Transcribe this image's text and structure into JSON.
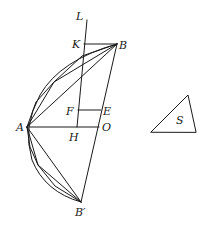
{
  "diagram": {
    "points": {
      "L": {
        "label": "L",
        "x": 87,
        "y": 20,
        "lx": 76,
        "ly": 20
      },
      "K": {
        "label": "K",
        "x": 84,
        "y": 44,
        "lx": 72,
        "ly": 48
      },
      "B": {
        "label": "B",
        "x": 117,
        "y": 44,
        "lx": 119,
        "ly": 49
      },
      "F": {
        "label": "F",
        "x": 78,
        "y": 110,
        "lx": 66,
        "ly": 115
      },
      "E": {
        "label": "E",
        "x": 101,
        "y": 110,
        "lx": 103,
        "ly": 115
      },
      "A": {
        "label": "A",
        "x": 27,
        "y": 127,
        "lx": 16,
        "ly": 131
      },
      "H": {
        "label": "H",
        "x": 77,
        "y": 127,
        "lx": 69,
        "ly": 141
      },
      "O": {
        "label": "O",
        "x": 99,
        "y": 127,
        "lx": 102,
        "ly": 131
      },
      "B2": {
        "label": "B′",
        "x": 81,
        "y": 202,
        "lx": 75,
        "ly": 216
      },
      "S": {
        "label": "S",
        "lx": 176,
        "ly": 124
      }
    },
    "triangle_S": {
      "vertices": [
        [
          151,
          132
        ],
        [
          188,
          95
        ],
        [
          196,
          132
        ]
      ]
    },
    "parabola_vertices_upper": [
      [
        54,
        82
      ]
    ],
    "parabola_vertices_lower": [
      [
        38,
        165
      ]
    ],
    "ink_color": "#1a1a1a"
  }
}
